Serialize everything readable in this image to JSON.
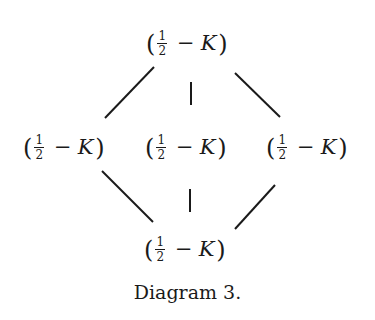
{
  "diagram": {
    "nodes": [
      {
        "id": "top",
        "fraction_num": "1",
        "fraction_den": "2",
        "operator": "−",
        "variable": "K",
        "open": "(",
        "close": ")"
      },
      {
        "id": "left",
        "fraction_num": "1",
        "fraction_den": "2",
        "operator": "−",
        "variable": "K",
        "open": "(",
        "close": ")"
      },
      {
        "id": "center",
        "fraction_num": "1",
        "fraction_den": "2",
        "operator": "−",
        "variable": "K",
        "open": "(",
        "close": ")"
      },
      {
        "id": "right",
        "fraction_num": "1",
        "fraction_den": "2",
        "operator": "−",
        "variable": "K",
        "open": "(",
        "close": ")"
      },
      {
        "id": "bottom",
        "fraction_num": "1",
        "fraction_den": "2",
        "operator": "−",
        "variable": "K",
        "open": "(",
        "close": ")"
      }
    ],
    "edges": [
      {
        "from": "top",
        "to": "left"
      },
      {
        "from": "top",
        "to": "center"
      },
      {
        "from": "top",
        "to": "right"
      },
      {
        "from": "left",
        "to": "bottom"
      },
      {
        "from": "center",
        "to": "bottom"
      },
      {
        "from": "right",
        "to": "bottom"
      }
    ],
    "caption": "Diagram 3."
  }
}
